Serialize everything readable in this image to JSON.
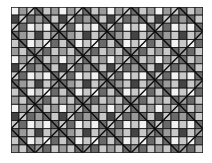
{
  "quilt": {
    "cols": 24,
    "rows": 18,
    "cell_size": 8,
    "block_size": 6,
    "palette": {
      "white": "#f2f2f2",
      "light": "#c8c8c8",
      "mid": "#9a9a9a",
      "dark": "#6a6a6a",
      "darker": "#444444",
      "line": "#0a0a0a"
    },
    "block_pattern": [
      [
        "white",
        "mid",
        "light",
        "dark",
        "light",
        "mid"
      ],
      [
        "darker",
        "light",
        "dark",
        "mid",
        "dark",
        "light"
      ],
      [
        "light",
        "dark",
        "white",
        "light",
        "white",
        "dark"
      ],
      [
        "dark",
        "mid",
        "light",
        "darker",
        "light",
        "mid"
      ],
      [
        "light",
        "dark",
        "white",
        "light",
        "white",
        "dark"
      ],
      [
        "mid",
        "light",
        "dark",
        "mid",
        "dark",
        "light"
      ]
    ],
    "diagonal_style": "diamond-in-square"
  }
}
